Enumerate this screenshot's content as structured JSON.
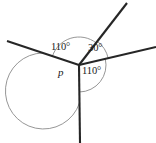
{
  "figure": {
    "name": "angle-diagram-around-point",
    "canvas": {
      "width": 156,
      "height": 143,
      "background": "#ffffff"
    },
    "colors": {
      "ray_stroke": "#262626",
      "arc_stroke": "#8a8a8a",
      "text": "#1a1a1a"
    },
    "vertex": {
      "x": 79,
      "y": 65
    },
    "rays": [
      {
        "name": "ray-upper-left",
        "x2": 7,
        "y2": 41
      },
      {
        "name": "ray-upper-right",
        "x2": 127,
        "y2": 3
      },
      {
        "name": "ray-right",
        "x2": 156,
        "y2": 47
      },
      {
        "name": "ray-down",
        "x2": 80,
        "y2": 143
      }
    ],
    "arcs": [
      {
        "name": "arc-110-top-left",
        "radius": 28
      },
      {
        "name": "arc-30-top-right",
        "radius": 30
      },
      {
        "name": "arc-110-bottom-right",
        "radius": 27
      },
      {
        "name": "arc-p-large",
        "radius": 38
      }
    ],
    "labels": {
      "top_left": "110°",
      "top_right": "30°",
      "bottom_right": "110°",
      "unknown": "p"
    }
  }
}
